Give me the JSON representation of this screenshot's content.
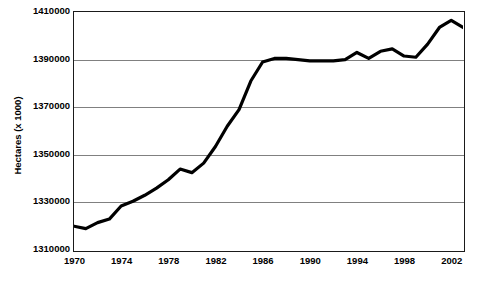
{
  "chart_data": {
    "type": "line",
    "title": "",
    "xlabel": "",
    "ylabel": "Hectares (x 1000)",
    "xlim": [
      1970,
      2003
    ],
    "ylim": [
      1310000,
      1410000
    ],
    "grid": true,
    "legend": false,
    "legend_position": "none",
    "y_ticks": [
      1410000,
      1390000,
      1370000,
      1350000,
      1330000,
      1310000
    ],
    "y_tick_labels": [
      "1410000",
      "1390000",
      "1370000",
      "1350000",
      "1330000",
      "1310000"
    ],
    "x_ticks": [
      1970,
      1974,
      1978,
      1982,
      1986,
      1990,
      1994,
      1998,
      2002
    ],
    "x_tick_labels": [
      "1970",
      "1974",
      "1978",
      "1982",
      "1986",
      "1990",
      "1994",
      "1998",
      "2002"
    ],
    "series": [
      {
        "name": "Hectares",
        "color": "#000000",
        "line_width": 3,
        "x": [
          1970,
          1971,
          1972,
          1973,
          1974,
          1975,
          1976,
          1977,
          1978,
          1979,
          1980,
          1981,
          1982,
          1983,
          1984,
          1985,
          1986,
          1987,
          1988,
          1989,
          1990,
          1991,
          1992,
          1993,
          1994,
          1995,
          1996,
          1997,
          1998,
          1999,
          2000,
          2001,
          2002,
          2003
        ],
        "values": [
          1320000,
          1319000,
          1321500,
          1323000,
          1328500,
          1330500,
          1333000,
          1336000,
          1339500,
          1344000,
          1342500,
          1346500,
          1353500,
          1362000,
          1369000,
          1381000,
          1389000,
          1390500,
          1390500,
          1390000,
          1389500,
          1389500,
          1389500,
          1390000,
          1393000,
          1390500,
          1393500,
          1394500,
          1391500,
          1391000,
          1396500,
          1403500,
          1406500,
          1403500
        ]
      }
    ]
  }
}
